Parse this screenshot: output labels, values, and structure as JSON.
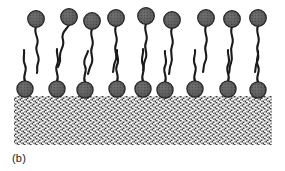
{
  "figure": {
    "panel_label": "(b)",
    "caption_visible": "(b)",
    "width": 285,
    "height": 171,
    "background_color": "#ffffff"
  },
  "colors": {
    "head_fill": "#5a5a5a",
    "head_fill_light": "#787878",
    "head_stroke": "#1c1c1c",
    "tail_stroke": "#1a1a1a",
    "substrate_dark": "#3d3d3d",
    "substrate_light": "#f2f2f2",
    "substrate_mid": "#b9b9b9",
    "label_color": "#1a1a1a",
    "background": "#ffffff"
  },
  "substrate": {
    "name": "solid-substrate",
    "x": 14,
    "y": 96,
    "width": 258,
    "height": 49,
    "pattern": "dense-dither-hatch",
    "pattern_cell": 3
  },
  "geometry": {
    "head_radius_top": 8.2,
    "head_radius_bottom": 8.0,
    "head_stroke_width": 1.4,
    "tail_stroke_width": 2.1
  },
  "upper_layer": {
    "name": "upper-surfactant-row",
    "count": 9,
    "orientation": "heads-up-tails-down",
    "molecules": [
      {
        "id": 1,
        "head_x": 36,
        "head_y": 19,
        "tail": "M36,27 C33,34 40,38 37,45 C34,52 41,56 38,63 C36,68 38,70 37,73"
      },
      {
        "id": 2,
        "head_x": 69,
        "head_y": 17,
        "tail": "M69,25 C65,31 61,33 63,40 C65,47 59,50 60,57 C61,62 59,64 58,67"
      },
      {
        "id": 3,
        "head_x": 92,
        "head_y": 21,
        "tail": "M92,29 C89,36 95,40 92,47 C89,54 95,58 91,65 C89,69 89,71 88,74"
      },
      {
        "id": 4,
        "head_x": 116,
        "head_y": 18,
        "tail": "M116,26 C113,33 119,37 116,44 C113,51 119,55 115,62 C113,66 114,69 113,72"
      },
      {
        "id": 5,
        "head_x": 146,
        "head_y": 16,
        "tail": "M146,24 C143,31 149,35 146,42 C143,49 149,53 145,60 C143,65 144,67 143,70"
      },
      {
        "id": 6,
        "head_x": 172,
        "head_y": 20,
        "tail": "M172,28 C169,35 175,39 172,46 C169,53 174,57 171,64 C169,68 170,71 169,74"
      },
      {
        "id": 7,
        "head_x": 206,
        "head_y": 18,
        "tail": "M206,26 C203,33 209,37 206,44 C203,51 209,55 205,62 C203,66 204,69 203,72"
      },
      {
        "id": 8,
        "head_x": 232,
        "head_y": 19,
        "tail": "M232,27 C229,34 235,38 232,45 C229,52 234,56 231,63 C229,67 230,70 229,73"
      },
      {
        "id": 9,
        "head_x": 258,
        "head_y": 18,
        "tail": "M258,26 C255,33 261,37 258,44 C255,51 261,55 257,62 C255,66 256,69 255,72"
      }
    ]
  },
  "lower_layer": {
    "name": "lower-surfactant-row",
    "count": 9,
    "orientation": "heads-down-on-substrate-tails-up",
    "molecules": [
      {
        "id": 1,
        "head_x": 25,
        "head_y": 89,
        "tail": "M25,81 C22,75 28,71 25,65 C22,59 25,55 24,50"
      },
      {
        "id": 2,
        "head_x": 57,
        "head_y": 89,
        "tail": "M57,81 C60,75 54,71 57,65 C60,59 56,55 57,49"
      },
      {
        "id": 3,
        "head_x": 85,
        "head_y": 90,
        "tail": "M85,82 C82,76 88,72 85,66 C82,60 87,56 88,51"
      },
      {
        "id": 4,
        "head_x": 117,
        "head_y": 89,
        "tail": "M117,81 C120,75 114,71 117,65 C120,59 116,55 117,50"
      },
      {
        "id": 5,
        "head_x": 143,
        "head_y": 89,
        "tail": "M143,81 C140,75 146,71 143,65 C140,59 144,55 143,49"
      },
      {
        "id": 6,
        "head_x": 165,
        "head_y": 90,
        "tail": "M165,82 C168,76 162,72 165,66 C168,60 164,56 165,51"
      },
      {
        "id": 7,
        "head_x": 195,
        "head_y": 89,
        "tail": "M195,81 C192,75 198,71 195,65 C192,59 196,55 195,50"
      },
      {
        "id": 8,
        "head_x": 228,
        "head_y": 89,
        "tail": "M228,81 C231,75 225,71 228,65 C231,59 227,55 228,50"
      },
      {
        "id": 9,
        "head_x": 258,
        "head_y": 90,
        "tail": "M258,82 C255,76 261,72 258,66 C255,60 259,56 258,51"
      }
    ]
  }
}
